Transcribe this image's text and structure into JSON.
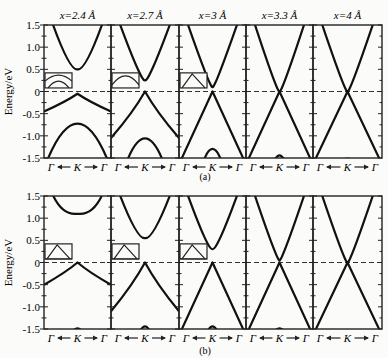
{
  "figure": {
    "ylabel": "Energy/eV",
    "yticks": [
      "1.5",
      "1.0",
      "0.5",
      "0",
      "-0.5",
      "-1.0",
      "-1.5"
    ],
    "ytick_values": [
      1.5,
      1.0,
      0.5,
      0,
      -0.5,
      -1.0,
      -1.5
    ],
    "xticks": [
      "Γ",
      "K",
      "Γ"
    ],
    "panel_titles": [
      "x=2.4 Å",
      "x=2.7 Å",
      "x=3 Å",
      "x=3.3 Å",
      "x=4 Å"
    ],
    "subfigure_a_caption": "(a)",
    "subfigure_b_caption": "(b)"
  },
  "chart_data": [
    {
      "type": "line",
      "title": "(a)",
      "xlabel": "Γ ← K → Γ",
      "ylabel": "Energy/eV",
      "ylim": [
        -1.5,
        1.5
      ],
      "fermi_level": 0,
      "panels": [
        {
          "label": "x=2.4 Å",
          "conduction_min_at_K": 0.5,
          "valence_max_at_K": -0.05,
          "lower_valence_max_at_K": -0.65,
          "valence_at_Gamma": -0.45,
          "inset": true
        },
        {
          "label": "x=2.7 Å",
          "conduction_min_at_K": 0.25,
          "valence_max_at_K": 0.0,
          "lower_valence_max_at_K": -1.0,
          "valence_at_Gamma": -1.05,
          "inset": true
        },
        {
          "label": "x=3 Å",
          "conduction_min_at_K": 0.1,
          "valence_max_at_K": 0.0,
          "lower_valence_max_at_K": -1.25,
          "valence_at_Gamma": -1.5,
          "inset": true
        },
        {
          "label": "x=3.3 Å",
          "conduction_min_at_K": 0.0,
          "valence_max_at_K": 0.0,
          "lower_valence_max_at_K": -1.4,
          "valence_at_Gamma": -1.5,
          "inset": false
        },
        {
          "label": "x=4 Å",
          "conduction_min_at_K": 0.0,
          "valence_max_at_K": 0.0,
          "lower_valence_max_at_K": -1.48,
          "valence_at_Gamma": -1.5,
          "inset": false
        }
      ]
    },
    {
      "type": "line",
      "title": "(b)",
      "xlabel": "Γ ← K → Γ",
      "ylabel": "Energy/eV",
      "ylim": [
        -1.5,
        1.5
      ],
      "fermi_level": 0,
      "panels": [
        {
          "label": "x=2.4 Å",
          "conduction_min_at_K": 1.1,
          "valence_max_at_K": 0.0,
          "lower_valence_max_at_K": -1.45,
          "valence_at_Gamma": -0.5,
          "inset": true
        },
        {
          "label": "x=2.7 Å",
          "conduction_min_at_K": 0.55,
          "valence_max_at_K": 0.0,
          "lower_valence_max_at_K": -1.4,
          "valence_at_Gamma": -1.1,
          "inset": true
        },
        {
          "label": "x=3 Å",
          "conduction_min_at_K": 0.3,
          "valence_max_at_K": 0.0,
          "lower_valence_max_at_K": -1.4,
          "valence_at_Gamma": -1.5,
          "inset": true
        },
        {
          "label": "x=3.3 Å",
          "conduction_min_at_K": 0.05,
          "valence_max_at_K": 0.0,
          "lower_valence_max_at_K": -1.45,
          "valence_at_Gamma": -1.5,
          "inset": false
        },
        {
          "label": "x=4 Å",
          "conduction_min_at_K": 0.0,
          "valence_max_at_K": 0.0,
          "lower_valence_max_at_K": -1.49,
          "valence_at_Gamma": -1.5,
          "inset": false
        }
      ]
    }
  ]
}
